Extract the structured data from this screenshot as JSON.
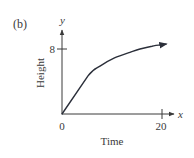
{
  "figure": {
    "panel_label": "(b)"
  },
  "chart_data": {
    "type": "line",
    "title": "",
    "panel": "(b)",
    "xlabel": "Time",
    "ylabel": "Height",
    "x_axis_var": "x",
    "y_axis_var": "y",
    "x_ticks": [
      0,
      20
    ],
    "x_tick_labels": [
      "0",
      "20"
    ],
    "y_ticks": [
      8
    ],
    "y_tick_labels": [
      "8"
    ],
    "xlim": [
      0,
      22
    ],
    "ylim": [
      0,
      10
    ],
    "grid": false,
    "legend": null,
    "series": [
      {
        "name": "height vs time",
        "x": [
          0,
          5.2,
          7.6,
          10.5,
          13.6,
          15.6,
          18.0,
          20.8
        ],
        "y": [
          0,
          4.7,
          5.9,
          6.9,
          7.6,
          8.0,
          8.35,
          8.6
        ],
        "arrow_at_end": true
      }
    ],
    "origin_label": "0"
  },
  "colors": {
    "axis": "#3a3a3a",
    "curve": "#2b2f3a",
    "text": "#3a3a3a",
    "background": "#ffffff"
  },
  "layout": {
    "origin_px": [
      62,
      114
    ],
    "x_px_per_unit": 5,
    "y_px_per_unit": 8.125
  }
}
